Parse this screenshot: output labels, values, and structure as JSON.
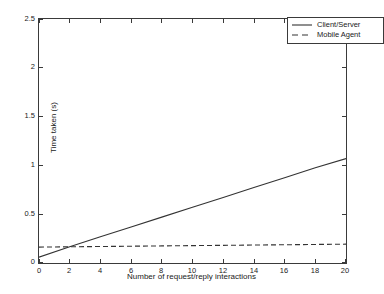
{
  "chart_data": {
    "type": "line",
    "title": "",
    "xlabel": "Number of request/reply interactions",
    "ylabel": "Time taken (s)",
    "xlim": [
      0,
      20
    ],
    "ylim": [
      0,
      2.5
    ],
    "xticks": [
      "0",
      "2",
      "4",
      "6",
      "8",
      "10",
      "12",
      "14",
      "16",
      "18",
      "20"
    ],
    "yticks": [
      "0",
      "0.5",
      "1",
      "1.5",
      "2",
      "2.5"
    ],
    "grid": false,
    "legend_position": "top-right",
    "x": [
      0,
      2,
      4,
      6,
      8,
      10,
      12,
      14,
      16,
      18,
      20
    ],
    "series": [
      {
        "name": "Client/Server",
        "style": "solid",
        "color": "#333333",
        "values": [
          0.06,
          0.167,
          0.268,
          0.369,
          0.47,
          0.571,
          0.672,
          0.773,
          0.874,
          0.975,
          1.07
        ]
      },
      {
        "name": "Mobile Agent",
        "style": "dashed",
        "color": "#333333",
        "values": [
          0.163,
          0.166,
          0.169,
          0.172,
          0.175,
          0.178,
          0.181,
          0.184,
          0.187,
          0.19,
          0.193
        ]
      }
    ],
    "annotations": []
  },
  "legend": {
    "entries": [
      {
        "label": "Client/Server"
      },
      {
        "label": "Mobile Agent"
      }
    ]
  },
  "colors": {
    "axis": "#3a3a3a",
    "text": "#1a1a1a",
    "background": "#ffffff",
    "line": "#333333"
  }
}
